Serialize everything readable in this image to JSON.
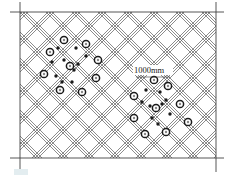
{
  "diagram": {
    "type": "engineering-plan",
    "frame": {
      "left": 20,
      "right": 216,
      "top": 12,
      "bottom": 158
    },
    "line_color": "#555555",
    "marker_color": "#1a1a1a",
    "dimension_label": "1000mm",
    "caption_text": "",
    "clusters": [
      {
        "name": "left-cluster",
        "rings": [
          [
            64,
            40
          ],
          [
            86,
            44
          ],
          [
            50,
            52
          ],
          [
            98,
            60
          ],
          [
            70,
            66
          ],
          [
            44,
            74
          ],
          [
            96,
            78
          ],
          [
            60,
            90
          ],
          [
            82,
            92
          ]
        ],
        "dots": [
          [
            58,
            48
          ],
          [
            76,
            48
          ],
          [
            86,
            56
          ],
          [
            52,
            62
          ],
          [
            64,
            60
          ],
          [
            74,
            70
          ],
          [
            78,
            64
          ],
          [
            56,
            76
          ],
          [
            72,
            82
          ],
          [
            62,
            82
          ]
        ]
      },
      {
        "name": "right-cluster",
        "rings": [
          [
            154,
            80
          ],
          [
            134,
            96
          ],
          [
            168,
            86
          ],
          [
            156,
            108
          ],
          [
            180,
            104
          ],
          [
            134,
            118
          ],
          [
            145,
            134
          ],
          [
            166,
            132
          ],
          [
            188,
            122
          ]
        ],
        "dots": [
          [
            146,
            90
          ],
          [
            160,
            92
          ],
          [
            142,
            102
          ],
          [
            150,
            106
          ],
          [
            162,
            104
          ],
          [
            170,
            114
          ],
          [
            152,
            118
          ],
          [
            166,
            100
          ],
          [
            158,
            124
          ]
        ]
      }
    ]
  }
}
